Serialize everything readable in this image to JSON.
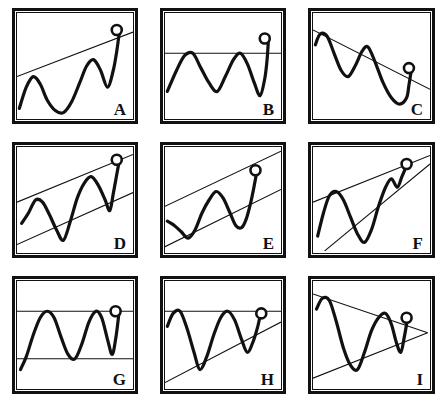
{
  "figure": {
    "columns": 3,
    "rows": 3,
    "background_color": "#ffffff",
    "ink_color": "#111111"
  },
  "chart_data": {
    "type": "line",
    "xlabel": "",
    "ylabel": "",
    "xlim": [
      0,
      100
    ],
    "ylim": [
      0,
      100
    ],
    "grid": false,
    "legend": "none",
    "panels": [
      {
        "letter": "A",
        "pattern_name": "Rising trendline support",
        "marker": {
          "name": "breakout-marker",
          "x": 86,
          "y": 84
        },
        "lines": [
          {
            "name": "rising-support-line",
            "x1": 0,
            "y1": 40,
            "x2": 100,
            "y2": 82
          }
        ],
        "price_path": "2,10 8,30 14,40 20,33 26,18 33,8 40,6 47,16 54,34 60,50 66,56 72,46 78,30 83,46 86,64 88,80"
      },
      {
        "letter": "B",
        "pattern_name": "Horizontal resistance breakout",
        "marker": {
          "name": "breakout-marker",
          "x": 86,
          "y": 76
        },
        "lines": [
          {
            "name": "horizontal-resistance-line",
            "x1": 0,
            "y1": 62,
            "x2": 100,
            "y2": 62
          }
        ],
        "price_path": "2,26 10,46 17,60 24,62 31,48 38,34 45,26 52,40 59,56 65,62 71,52 77,34 82,22 86,38 88,56 89,72"
      },
      {
        "letter": "C",
        "pattern_name": "Falling trendline resistance breakout",
        "marker": {
          "name": "breakout-marker",
          "x": 82,
          "y": 48
        },
        "lines": [
          {
            "name": "falling-resistance-line",
            "x1": 0,
            "y1": 84,
            "x2": 100,
            "y2": 28
          }
        ],
        "price_path": "2,70 6,80 12,78 18,62 24,46 30,40 36,50 42,64 47,68 53,54 60,34 67,20 74,14 80,20 82,32 84,46"
      },
      {
        "letter": "D",
        "pattern_name": "Ascending channel",
        "marker": {
          "name": "breakout-marker",
          "x": 86,
          "y": 88
        },
        "lines": [
          {
            "name": "channel-upper-line",
            "x1": 0,
            "y1": 48,
            "x2": 100,
            "y2": 93
          },
          {
            "name": "channel-lower-line",
            "x1": 0,
            "y1": 8,
            "x2": 100,
            "y2": 57
          }
        ],
        "price_path": "4,28 10,38 16,50 22,48 28,36 34,22 40,12 46,30 52,52 58,66 64,72 70,64 76,50 80,40 83,56 86,74 88,86"
      },
      {
        "letter": "E",
        "pattern_name": "Ascending channel (narrow)",
        "marker": {
          "name": "breakout-marker",
          "x": 78,
          "y": 78
        },
        "lines": [
          {
            "name": "channel-upper-line",
            "x1": 0,
            "y1": 44,
            "x2": 100,
            "y2": 96
          },
          {
            "name": "channel-lower-line",
            "x1": 0,
            "y1": 6,
            "x2": 100,
            "y2": 60
          }
        ],
        "price_path": "2,30 8,26 14,20 20,14 26,22 32,38 38,50 44,58 50,52 56,38 61,26 66,24 70,32 74,48 77,64 79,76"
      },
      {
        "letter": "F",
        "pattern_name": "Rising wedge",
        "marker": {
          "name": "breakout-marker",
          "x": 80,
          "y": 84
        },
        "lines": [
          {
            "name": "wedge-upper-line",
            "x1": 0,
            "y1": 48,
            "x2": 100,
            "y2": 92
          },
          {
            "name": "wedge-lower-line",
            "x1": 10,
            "y1": 2,
            "x2": 100,
            "y2": 84
          }
        ],
        "price_path": "4,16 9,38 14,54 20,58 26,50 32,34 38,18 44,10 50,22 56,44 62,62 67,70 72,62 76,72 79,80"
      },
      {
        "letter": "G",
        "pattern_name": "Horizontal rectangle range",
        "marker": {
          "name": "breakout-marker",
          "x": 85,
          "y": 72
        },
        "lines": [
          {
            "name": "rectangle-upper-line",
            "x1": 0,
            "y1": 72,
            "x2": 100,
            "y2": 72
          },
          {
            "name": "rectangle-lower-line",
            "x1": 0,
            "y1": 28,
            "x2": 100,
            "y2": 28
          }
        ],
        "price_path": "3,18 8,30 14,50 20,66 26,72 32,66 38,48 44,32 50,28 56,42 62,62 68,72 73,66 78,46 82,32 85,46 87,62 88,72"
      },
      {
        "letter": "H",
        "pattern_name": "Ascending triangle",
        "marker": {
          "name": "breakout-marker",
          "x": 83,
          "y": 70
        },
        "lines": [
          {
            "name": "triangle-horizontal-resistance",
            "x1": 0,
            "y1": 72,
            "x2": 100,
            "y2": 72
          },
          {
            "name": "triangle-rising-support",
            "x1": 0,
            "y1": 6,
            "x2": 100,
            "y2": 62
          }
        ],
        "price_path": "2,58 7,70 13,72 19,56 25,34 30,18 36,30 42,50 48,66 54,72 60,64 66,46 71,34 76,44 80,58 82,68"
      },
      {
        "letter": "I",
        "pattern_name": "Symmetrical triangle",
        "marker": {
          "name": "breakout-marker",
          "x": 80,
          "y": 66
        },
        "lines": [
          {
            "name": "triangle-upper-line",
            "x1": 0,
            "y1": 88,
            "x2": 98,
            "y2": 52
          },
          {
            "name": "triangle-lower-line",
            "x1": 0,
            "y1": 10,
            "x2": 98,
            "y2": 52
          }
        ],
        "price_path": "3,74 8,84 14,82 20,62 26,38 32,22 38,18 44,34 50,54 56,66 62,70 67,60 71,44 75,34 78,48 80,60"
      }
    ]
  }
}
